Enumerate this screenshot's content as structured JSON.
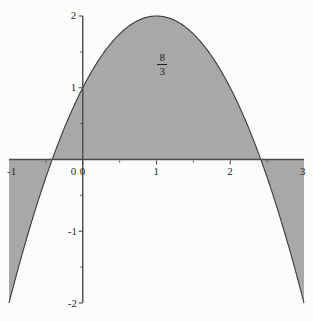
{
  "chart_data": {
    "type": "area",
    "title": "",
    "subtitle": "",
    "xlabel": "",
    "ylabel": "",
    "function": "y = 2 - (x - 1)^2",
    "xlim": [
      -1,
      3
    ],
    "ylim": [
      -2,
      2
    ],
    "x_ticks": [
      -1,
      0,
      1,
      2,
      3
    ],
    "x_tick_labels": [
      "-1",
      "0",
      "1",
      "2",
      "3"
    ],
    "x_minor_ticks": [
      -0.5,
      0.5,
      1.5,
      2.5
    ],
    "y_ticks": [
      -2,
      -1,
      0,
      1,
      2
    ],
    "y_tick_labels": [
      "-2",
      "-1",
      "0",
      "1",
      "2"
    ],
    "y_minor_ticks": [
      -1.5,
      -0.5,
      0.5,
      1.5
    ],
    "grid": false,
    "legend": null,
    "fill_color": "#a8a8a8",
    "curve_color": "#3a3a3a",
    "axis_color": "#4a4a4a",
    "background_color": "#fcfcfc",
    "roots": [
      -0.4142,
      2.4142
    ],
    "vertex": [
      1,
      2
    ],
    "y_intercept": 1,
    "annotations": [
      {
        "name": "area-value",
        "numerator": "8",
        "denominator": "3",
        "x": 1.08,
        "y": 1.32
      }
    ],
    "x": [
      -1,
      -0.9,
      -0.8,
      -0.7,
      -0.6,
      -0.5,
      -0.4142,
      -0.4,
      -0.3,
      -0.2,
      -0.1,
      0,
      0.1,
      0.2,
      0.3,
      0.4,
      0.5,
      0.6,
      0.7,
      0.8,
      0.9,
      1,
      1.1,
      1.2,
      1.3,
      1.4,
      1.5,
      1.6,
      1.7,
      1.8,
      1.9,
      2,
      2.1,
      2.2,
      2.3,
      2.4142,
      2.5,
      2.6,
      2.7,
      2.8,
      2.9,
      3
    ],
    "y": [
      -2,
      -1.61,
      -1.24,
      -0.89,
      -0.56,
      -0.25,
      0,
      0.04,
      0.31,
      0.56,
      0.79,
      1,
      1.19,
      1.36,
      1.51,
      1.64,
      1.75,
      1.84,
      1.91,
      1.96,
      1.99,
      2,
      1.99,
      1.96,
      1.91,
      1.84,
      1.75,
      1.64,
      1.51,
      1.36,
      1.19,
      1,
      0.79,
      0.56,
      0.31,
      0,
      -0.25,
      -0.56,
      -0.89,
      -1.24,
      -1.61,
      -2
    ]
  },
  "axes": {
    "x_axis_name": "x-axis",
    "y_axis_name": "y-axis"
  }
}
